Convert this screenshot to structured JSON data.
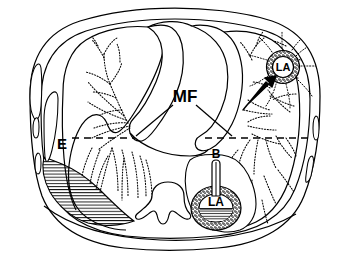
{
  "figure": {
    "background_color": "#ffffff",
    "ink_color": "#000000",
    "width": 346,
    "height": 261
  },
  "labels": {
    "effusion": "E",
    "meniscus_fat": "MF",
    "bronchus": "B",
    "lung_abscess_upper": "LA",
    "lung_abscess_lower": "LA"
  },
  "annotations": {
    "arrow": "arrow pointing to upper right lung abscess",
    "dashed_line_left": "air-fluid level line on left",
    "dashed_line_right": "air-fluid level line on right",
    "leader_line_left": "MF leader line to left mediastinal border",
    "leader_line_right": "MF leader line to right mediastinal border"
  },
  "structures": {
    "body_wall": "chest wall outline",
    "ribs_left": "left rib cross-sections",
    "ribs_right": "right rib cross-sections",
    "vertebral_body": "vertebral body",
    "mediastinum": "central mediastinum / heart",
    "lung_markings_left": "stippled pulmonary vascular markings left",
    "lung_markings_right": "stippled pulmonary vascular markings right",
    "effusion_hatching": "horizontal hatched pleural fluid",
    "abscess_ring_upper": "stippled abscess wall upper right",
    "abscess_ring_lower": "stippled abscess wall lower right",
    "abscess_fluid_lower": "hatched fluid level inside lower abscess"
  }
}
